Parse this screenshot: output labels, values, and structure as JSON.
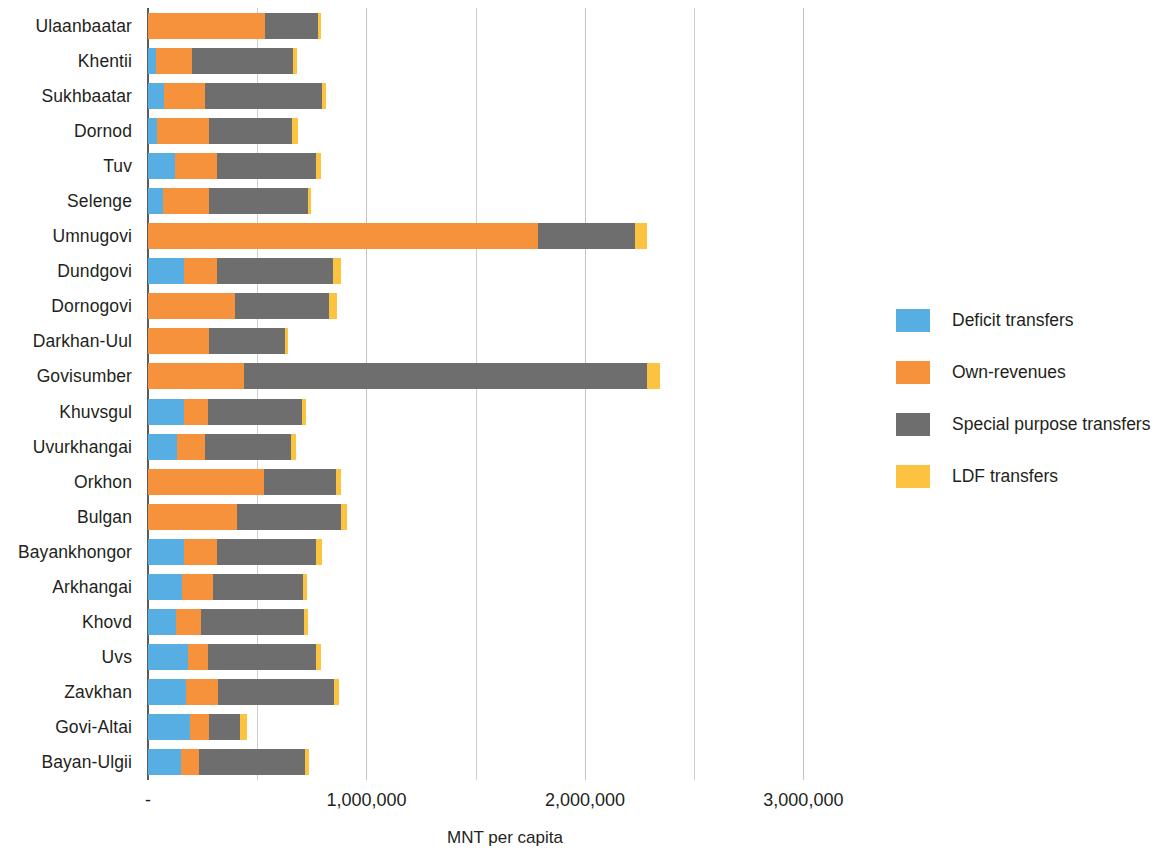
{
  "chart_data": {
    "type": "bar",
    "subtype": "horizontal-stacked",
    "title": "",
    "xlabel": "MNT per capita",
    "ylabel": "",
    "xlim": [
      0,
      3250000
    ],
    "xticks": [
      0,
      1000000,
      2000000,
      3000000
    ],
    "xtick_labels": [
      "-",
      "1,000,000",
      "2,000,000",
      "3,000,000"
    ],
    "gridlines": [
      0,
      500000,
      1000000,
      1500000,
      2000000,
      2500000,
      3000000
    ],
    "grid": true,
    "legend_position": "right",
    "categories": [
      "Ulaanbaatar",
      "Khentii",
      "Sukhbaatar",
      "Dornod",
      "Tuv",
      "Selenge",
      "Umnugovi",
      "Dundgovi",
      "Dornogovi",
      "Darkhan-Uul",
      "Govisumber",
      "Khuvsgul",
      "Uvurkhangai",
      "Orkhon",
      "Bulgan",
      "Bayankhongor",
      "Arkhangai",
      "Khovd",
      "Uvs",
      "Zavkhan",
      "Govi-Altai",
      "Bayan-Ulgii"
    ],
    "series": [
      {
        "name": "Deficit transfers",
        "color": "#56aee2",
        "values": [
          0,
          37000,
          75000,
          40000,
          122000,
          70000,
          0,
          163000,
          0,
          0,
          0,
          163000,
          135000,
          0,
          0,
          163000,
          154000,
          126000,
          182000,
          173000,
          192000,
          150000
        ]
      },
      {
        "name": "Own-revenues",
        "color": "#f6913c",
        "values": [
          537000,
          164000,
          187000,
          238000,
          196000,
          210000,
          1785000,
          154000,
          397000,
          280000,
          439000,
          112000,
          126000,
          533000,
          407000,
          154000,
          145000,
          117000,
          93000,
          149000,
          89000,
          84000
        ]
      },
      {
        "name": "Special purpose transfers",
        "color": "#6e6e6e",
        "values": [
          239000,
          463000,
          533000,
          379000,
          453000,
          453000,
          444000,
          528000,
          430000,
          346000,
          1846000,
          430000,
          393000,
          327000,
          477000,
          453000,
          411000,
          472000,
          495000,
          528000,
          140000,
          486000
        ]
      },
      {
        "name": "LDF transfers",
        "color": "#fcc340",
        "values": [
          14000,
          19000,
          19000,
          28000,
          19000,
          14000,
          56000,
          37000,
          37000,
          14000,
          61000,
          19000,
          23000,
          23000,
          28000,
          28000,
          19000,
          19000,
          23000,
          23000,
          33000,
          19000
        ]
      }
    ]
  },
  "legend": {
    "items": [
      {
        "label": "Deficit transfers",
        "color": "#56aee2",
        "icon": "legend-swatch-blue"
      },
      {
        "label": "Own-revenues",
        "color": "#f6913c",
        "icon": "legend-swatch-orange"
      },
      {
        "label": "Special purpose transfers",
        "color": "#6e6e6e",
        "icon": "legend-swatch-grey"
      },
      {
        "label": "LDF transfers",
        "color": "#fcc340",
        "icon": "legend-swatch-yellow"
      }
    ]
  }
}
